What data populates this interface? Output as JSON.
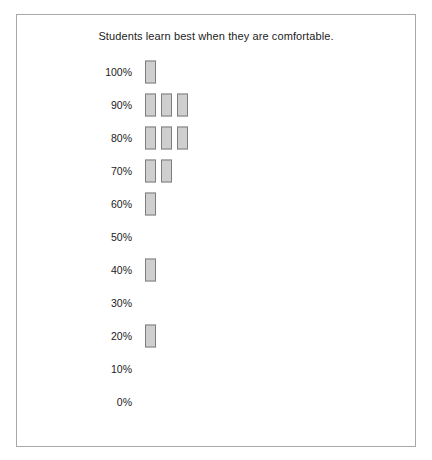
{
  "top_clip": {
    "fragments": [
      "",
      "",
      ""
    ]
  },
  "panel": {
    "title": "Students learn best when they are comfortable.",
    "border_color": "#a8a8a8",
    "background": "#ffffff"
  },
  "style": {
    "bar_fill": "#cfcfcf",
    "bar_border": "#7d7d7d",
    "text_color": "#1c1c1c"
  },
  "chart_data": {
    "type": "bar",
    "orientation": "horizontal-dotplot",
    "title": "Students learn best when they are comfortable.",
    "xlabel": "",
    "ylabel": "",
    "grid": false,
    "legend": null,
    "categories": [
      "100%",
      "90%",
      "80%",
      "70%",
      "60%",
      "50%",
      "40%",
      "30%",
      "20%",
      "10%",
      "0%"
    ],
    "values": [
      1,
      3,
      3,
      2,
      1,
      0,
      1,
      0,
      1,
      0,
      0
    ],
    "rows": [
      {
        "label": "100%",
        "count": 1
      },
      {
        "label": "90%",
        "count": 3
      },
      {
        "label": "80%",
        "count": 3
      },
      {
        "label": "70%",
        "count": 2
      },
      {
        "label": "60%",
        "count": 1
      },
      {
        "label": "50%",
        "count": 0
      },
      {
        "label": "40%",
        "count": 1
      },
      {
        "label": "30%",
        "count": 0
      },
      {
        "label": "20%",
        "count": 1
      },
      {
        "label": "10%",
        "count": 0
      },
      {
        "label": "0%",
        "count": 0
      }
    ]
  }
}
